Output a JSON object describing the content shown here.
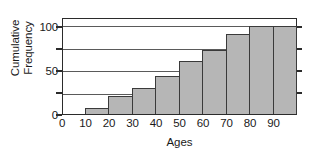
{
  "chart_data": {
    "type": "bar",
    "title": "",
    "subtitle": "",
    "xlabel": "Ages",
    "ylabel_lines": [
      "Cumulative",
      "Frequency"
    ],
    "ylabel": "Cumulative Frequency",
    "categories": [
      "0",
      "10",
      "20",
      "30",
      "40",
      "50",
      "60",
      "70",
      "80",
      "90"
    ],
    "bin_edges": [
      0,
      10,
      20,
      30,
      40,
      50,
      60,
      70,
      80,
      90,
      100
    ],
    "values": [
      0,
      7,
      20,
      30,
      43,
      60,
      73,
      91,
      100,
      100
    ],
    "xtick_labels": [
      "0",
      "10",
      "20",
      "30",
      "40",
      "50",
      "60",
      "70",
      "80",
      "90"
    ],
    "ytick_labels": [
      "0",
      "50",
      "100"
    ],
    "ytick_values": [
      0,
      50,
      100
    ],
    "gridline_values": [
      25,
      50,
      75,
      100
    ],
    "xlim": [
      0,
      100
    ],
    "ylim": [
      0,
      108
    ],
    "grid": true,
    "legend": null,
    "bar_fill_color": "#b6b6b6",
    "bar_edge_color": "#3a3a3a",
    "axis_color": "#2b2b2b",
    "grid_color": "#5a5a5a",
    "background_color": "#ffffff"
  }
}
